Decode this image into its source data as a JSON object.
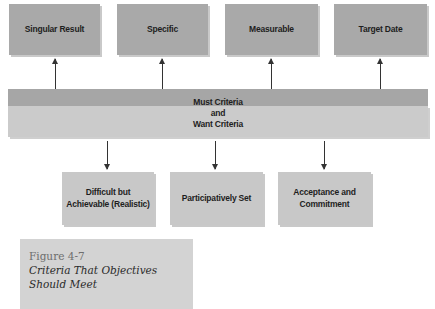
{
  "diagram": {
    "top_boxes": [
      {
        "label": "Singular Result"
      },
      {
        "label": "Specific"
      },
      {
        "label": "Measurable"
      },
      {
        "label": "Target Date"
      }
    ],
    "center": {
      "line1": "Must Criteria",
      "line2": "and",
      "line3": "Want Criteria"
    },
    "bottom_boxes": [
      {
        "line1": "Difficult but",
        "line2": "Achievable (Realistic)"
      },
      {
        "line1": "Participatively Set",
        "line2": ""
      },
      {
        "line1": "Acceptance and",
        "line2": "Commitment"
      }
    ],
    "colors": {
      "top_box": "#a9a9a9",
      "band_dark": "#a6a6a6",
      "band_light": "#cbcbcb",
      "bottom_box": "#c8c8c8",
      "caption_bg": "#d3d3d3"
    }
  },
  "caption": {
    "figure_number": "Figure 4-7",
    "title_line1": "Criteria That Objectives",
    "title_line2": "Should Meet"
  }
}
